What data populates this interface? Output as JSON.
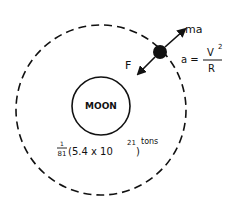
{
  "diagram": {
    "moon_label": "MOON",
    "mass_fraction_num": "1",
    "mass_fraction_den": "81",
    "mass_value": "(5.4 x 10",
    "mass_exponent": "21",
    "mass_close": ")",
    "mass_unit": "tons",
    "force_label": "F",
    "inertial_label": "ma",
    "accel_lhs": "a =",
    "accel_num": "V",
    "accel_num_exp": "2",
    "accel_den": "R"
  },
  "colors": {
    "ink": "#111111",
    "background": "#ffffff"
  }
}
